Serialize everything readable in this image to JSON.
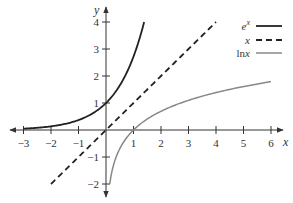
{
  "chart_data": {
    "type": "line",
    "title": "",
    "xlabel": "x",
    "ylabel": "y",
    "xlim": [
      -3.3,
      6.4
    ],
    "ylim": [
      -2.5,
      4.5
    ],
    "grid": false,
    "legend_position": "top-right",
    "x_ticks": [
      -3,
      -2,
      -1,
      1,
      2,
      3,
      4,
      5,
      6
    ],
    "x_tick_labels": [
      "−3",
      "−2",
      "−1",
      "1",
      "2",
      "3",
      "4",
      "5",
      "6"
    ],
    "y_ticks": [
      -2,
      -1,
      1,
      2,
      3,
      4
    ],
    "y_tick_labels": [
      "−2",
      "−1",
      "1",
      "2",
      "3",
      "4"
    ],
    "series": [
      {
        "name": "e^x",
        "label_base": "e",
        "label_sup": "x",
        "style": "solid",
        "color": "#222222",
        "width": 1.8,
        "function": "exp",
        "domain": [
          -3,
          1.386
        ],
        "points": [
          [
            -3,
            0.05
          ],
          [
            -2,
            0.14
          ],
          [
            -1,
            0.37
          ],
          [
            0,
            1
          ],
          [
            0.5,
            1.65
          ],
          [
            1,
            2.72
          ],
          [
            1.386,
            4
          ]
        ]
      },
      {
        "name": "x",
        "label_base": "x",
        "style": "dashed",
        "color": "#222222",
        "width": 1.8,
        "function": "identity",
        "domain": [
          -2,
          4
        ],
        "points": [
          [
            -2,
            -2
          ],
          [
            0,
            0
          ],
          [
            4,
            4
          ]
        ]
      },
      {
        "name": "ln x",
        "label_base": "ln x",
        "style": "solid",
        "color": "#888888",
        "width": 1.5,
        "function": "log",
        "domain": [
          0.135,
          6
        ],
        "points": [
          [
            0.135,
            -2
          ],
          [
            0.37,
            -1
          ],
          [
            1,
            0
          ],
          [
            2,
            0.69
          ],
          [
            3,
            1.1
          ],
          [
            4,
            1.39
          ],
          [
            5,
            1.61
          ],
          [
            6,
            1.79
          ]
        ]
      }
    ]
  },
  "legend": {
    "items": [
      {
        "label": "e",
        "sup": "x"
      },
      {
        "label": "x"
      },
      {
        "label": "ln x"
      }
    ]
  },
  "axes": {
    "x_title": "x",
    "y_title": "y"
  }
}
